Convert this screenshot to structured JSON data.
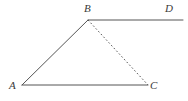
{
  "figure": {
    "kind": "geometry-diagram",
    "width": 188,
    "height": 101,
    "background_color": "#ffffff",
    "stroke_color": "#555555",
    "label_color": "#3a3a3a",
    "points": {
      "A": {
        "label": "A",
        "x": 22,
        "y": 85
      },
      "B": {
        "label": "B",
        "x": 88,
        "y": 20
      },
      "C": {
        "label": "C",
        "x": 148,
        "y": 85
      },
      "D": {
        "label": "D",
        "x": 183,
        "y": 20
      }
    },
    "segments": [
      {
        "name": "segment-AB",
        "from": "A",
        "to": "B",
        "style": "solid"
      },
      {
        "name": "segment-AC",
        "from": "A",
        "to": "C",
        "style": "solid"
      },
      {
        "name": "segment-BD",
        "from": "B",
        "to": "D",
        "style": "solid"
      },
      {
        "name": "segment-BC",
        "from": "B",
        "to": "C",
        "style": "dashed"
      }
    ]
  }
}
